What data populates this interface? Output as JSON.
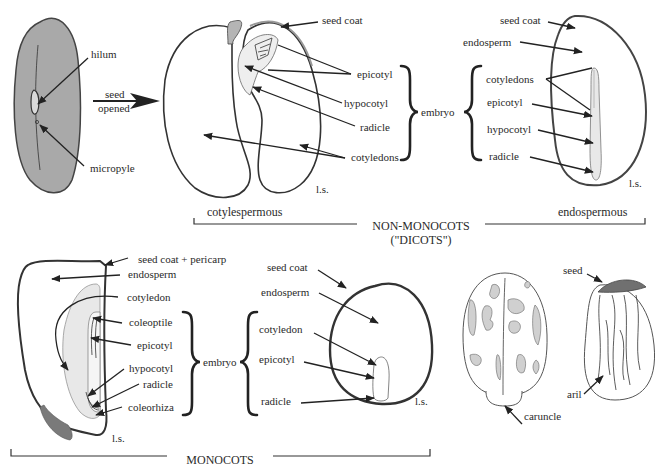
{
  "colors": {
    "seed_gray": "#a8a8a8",
    "light_gray": "#d9d9d9",
    "dark_gray": "#7a7a7a",
    "outline": "#333333",
    "text": "#2a2a2a"
  },
  "icons": {
    "arrow": "arrow-icon",
    "brace": "curly-brace-icon"
  },
  "whole_seed": {
    "labels": {
      "hilum": "hilum",
      "micropyle": "micropyle"
    },
    "transition": {
      "line1": "seed",
      "line2": "opened"
    }
  },
  "cotylespermous_seed": {
    "labels": {
      "seed_coat": "seed coat",
      "epicotyl": "epicotyl",
      "hypocotyl": "hypocotyl",
      "radicle": "radicle",
      "cotyledons": "cotyledons",
      "section": "l.s."
    }
  },
  "embryo_brace_top": {
    "label": "embryo"
  },
  "endospermous_seed": {
    "labels": {
      "seed_coat": "seed coat",
      "endosperm": "endosperm",
      "cotyledons": "cotyledons",
      "epicotyl": "epicotyl",
      "hypocotyl": "hypocotyl",
      "radicle": "radicle",
      "section": "l.s."
    }
  },
  "dicot_group": {
    "left_subtitle": "cotylespermous",
    "right_subtitle": "endospermous",
    "title_line1": "NON-MONOCOTS",
    "title_line2": "(\"DICOTS\")"
  },
  "grass_grain": {
    "labels": {
      "seed_coat_pericarp": "seed coat + pericarp",
      "endosperm": "endosperm",
      "cotyledon": "cotyledon",
      "coleoptile": "coleoptile",
      "epicotyl": "epicotyl",
      "hypocotyl": "hypocotyl",
      "radicle": "radicle",
      "coleorhiza": "coleorhiza",
      "section": "l.s."
    },
    "embryo_label": "embryo"
  },
  "onion_seed": {
    "labels": {
      "seed_coat": "seed coat",
      "endosperm": "endosperm",
      "cotyledon": "cotyledon",
      "epicotyl": "epicotyl",
      "radicle": "radicle",
      "section": "l.s."
    }
  },
  "monocot_group": {
    "title": "MONOCOTS"
  },
  "castor_seed": {
    "labels": {
      "caruncle": "caruncle"
    }
  },
  "arillate_seed": {
    "labels": {
      "seed": "seed",
      "aril": "aril"
    }
  }
}
